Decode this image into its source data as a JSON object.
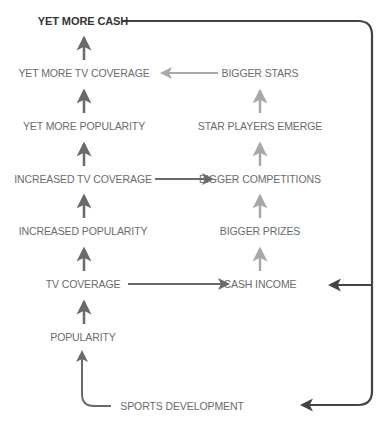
{
  "diagram": {
    "left_column": [
      {
        "id": "yet_more_cash",
        "label": "YET MORE CASH",
        "x": 83,
        "y": 15,
        "bold": true
      },
      {
        "id": "yet_more_tv",
        "label": "YET MORE TV COVERAGE",
        "x": 84,
        "y": 67
      },
      {
        "id": "yet_more_pop",
        "label": "YET MORE POPULARITY",
        "x": 84,
        "y": 120
      },
      {
        "id": "increased_tv",
        "label": "INCREASED TV COVERAGE",
        "x": 83,
        "y": 173
      },
      {
        "id": "increased_pop",
        "label": "INCREASED POPULARITY",
        "x": 83,
        "y": 225
      },
      {
        "id": "tv_coverage",
        "label": "TV COVERAGE",
        "x": 83,
        "y": 278
      },
      {
        "id": "popularity",
        "label": "POPULARITY",
        "x": 83,
        "y": 331
      }
    ],
    "right_column": [
      {
        "id": "bigger_stars",
        "label": "BIGGER STARS",
        "x": 260,
        "y": 67
      },
      {
        "id": "star_players",
        "label": "STAR PLAYERS EMERGE",
        "x": 260,
        "y": 120
      },
      {
        "id": "bigger_comp",
        "label": "BIGGER COMPETITIONS",
        "x": 260,
        "y": 173
      },
      {
        "id": "bigger_prizes",
        "label": "BIGGER PRIZES",
        "x": 260,
        "y": 225
      },
      {
        "id": "cash_income",
        "label": "CASH INCOME",
        "x": 260,
        "y": 278
      }
    ],
    "bottom": {
      "id": "sports_dev",
      "label": "SPORTS DEVELOPMENT",
      "x": 182,
      "y": 401
    },
    "colors": {
      "dark": "#444444",
      "medium": "#6a6a6a",
      "light": "#a8a8a8",
      "text": "#6b6b6b"
    }
  }
}
